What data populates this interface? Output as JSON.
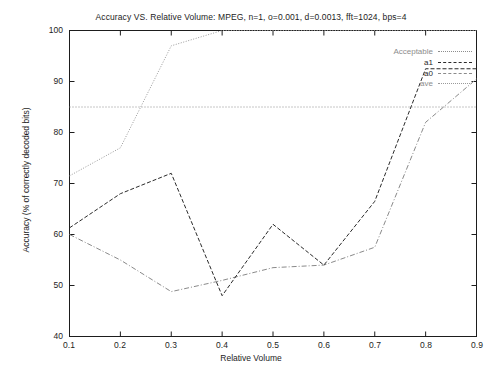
{
  "chart_data": {
    "type": "line",
    "title": "Accuracy VS. Relative Volume: MPEG, n=1, o=0.001, d=0.0013, fft=1024, bps=4",
    "xlabel": "Relative Volume",
    "ylabel": "Accuracy (% of correctly decoded bits)",
    "xlim": [
      0.1,
      0.9
    ],
    "ylim": [
      40,
      100
    ],
    "xticks": [
      "0.1",
      "0.2",
      "0.3",
      "0.4",
      "0.5",
      "0.6",
      "0.7",
      "0.8",
      "0.9"
    ],
    "yticks": [
      "40",
      "50",
      "60",
      "70",
      "80",
      "90",
      "100"
    ],
    "grid": false,
    "legend_position": "top-right",
    "x": [
      0.1,
      0.2,
      0.3,
      0.4,
      0.5,
      0.6,
      0.7,
      0.8,
      0.9
    ],
    "series": [
      {
        "name": "Acceptable",
        "style": "dotted",
        "color": "#8d8d8d",
        "constant": 85,
        "values": [
          85,
          85,
          85,
          85,
          85,
          85,
          85,
          85,
          85
        ]
      },
      {
        "name": "a1",
        "style": "dashed",
        "color": "#2a2a2a",
        "values": [
          61.3,
          68.0,
          72.0,
          48.0,
          62.0,
          54.0,
          66.5,
          92.5,
          92.5
        ]
      },
      {
        "name": "a0",
        "style": "dash-dot",
        "color": "#8a8a8a",
        "values": [
          60.0,
          55.0,
          48.8,
          51.0,
          53.5,
          54.0,
          57.5,
          82.0,
          90.5
        ]
      },
      {
        "name": "ave",
        "style": "fine-dotted",
        "color": "#9a9a9a",
        "values": [
          71.5,
          77.0,
          97.0,
          100.0,
          100.0,
          100.0,
          100.0,
          100.0,
          100.0
        ]
      }
    ]
  },
  "legend": {
    "entries": [
      {
        "label": "Acceptable"
      },
      {
        "label": "a1"
      },
      {
        "label": "a0"
      },
      {
        "label": "ave"
      }
    ]
  }
}
